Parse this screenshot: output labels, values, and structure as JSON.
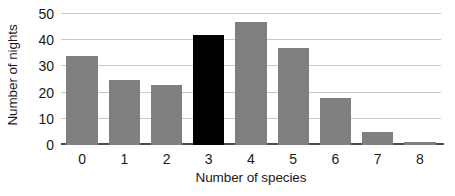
{
  "chart_data": {
    "type": "bar",
    "title": "",
    "subtitle": "",
    "xlabel": "Number of species",
    "ylabel": "Number of nights",
    "categories": [
      "0",
      "1",
      "2",
      "3",
      "4",
      "5",
      "6",
      "7",
      "8"
    ],
    "values": [
      34,
      25,
      23,
      42,
      47,
      37,
      18,
      5,
      1
    ],
    "series": [
      {
        "name": "Number of nights",
        "values": [
          34,
          25,
          23,
          42,
          47,
          37,
          18,
          5,
          1
        ]
      }
    ],
    "highlighted_category": "3",
    "highlighted_index": 3,
    "bar_colors": [
      "#808080",
      "#808080",
      "#808080",
      "#000000",
      "#808080",
      "#808080",
      "#808080",
      "#808080",
      "#808080"
    ],
    "ylim": [
      0,
      50
    ],
    "yticks": [
      0,
      10,
      20,
      30,
      40,
      50
    ],
    "ytick_labels": [
      "0",
      "10",
      "20",
      "30",
      "40",
      "50"
    ],
    "xtick_labels": [
      "0",
      "1",
      "2",
      "3",
      "4",
      "5",
      "6",
      "7",
      "8"
    ],
    "grid": true,
    "grid_axis": "y",
    "grid_color": "#c9c9c9",
    "axis_color": "#4d4d4d",
    "legend": false,
    "legend_position": "none",
    "background_color": "#ffffff",
    "default_bar_color": "#808080",
    "accent_color": "#000000",
    "annotations": []
  }
}
